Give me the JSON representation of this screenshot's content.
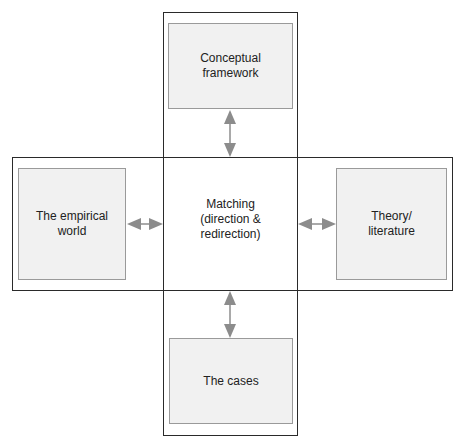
{
  "diagram": {
    "center": "Matching\n(direction &\nredirection)",
    "top": "Conceptual\nframework",
    "left": "The empirical\nworld",
    "right": "Theory/\nliterature",
    "bottom": "The cases",
    "colors": {
      "outline": "#2a2a2a",
      "box_fill": "#f1f1f1",
      "box_border": "#9a9a9a",
      "arrow": "#8c8c8c"
    }
  }
}
